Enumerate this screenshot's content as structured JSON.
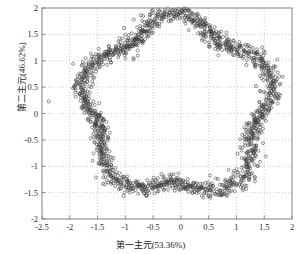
{
  "chart_data": {
    "type": "scatter",
    "title": "",
    "xlabel": "第一主元(53.36%)",
    "ylabel": "第二主元(46.62%)",
    "xlim": [
      -2.5,
      2
    ],
    "ylim": [
      -2,
      2
    ],
    "xticks": [
      -2.5,
      -2,
      -1.5,
      -1,
      -0.5,
      0,
      0.5,
      1,
      1.5,
      2
    ],
    "xtick_labels": [
      "-2.5",
      "-2",
      "-1.5",
      "-1",
      "-0.5",
      "0",
      "0.5",
      "1",
      "1.5",
      "2"
    ],
    "yticks": [
      -2,
      -1.5,
      -1,
      -0.5,
      0,
      0.5,
      1,
      1.5,
      2
    ],
    "ytick_labels": [
      "-2",
      "-1.5",
      "-1",
      "-0.5",
      "0",
      "0.5",
      "1",
      "1.5",
      "2"
    ],
    "grid": true,
    "grid_style": "dotted",
    "grid_color": "#b4b4b4",
    "frame_color": "#808080",
    "legend": null,
    "marker": "open-circle",
    "marker_size": 3.0,
    "marker_edge_color": "#3a3a3a",
    "marker_face_color": "none",
    "n_points": 1600,
    "ring": {
      "center": [
        -0.12,
        0.18
      ],
      "petals": 5,
      "base_radius": 1.62,
      "lobe_amplitude": 0.17,
      "phase_deg": 90,
      "radial_noise": 0.085
    },
    "outliers": [
      [
        -2.38,
        0.23
      ],
      [
        -1.5,
        -0.43
      ],
      [
        -1.02,
        1.62
      ],
      [
        -0.85,
        1.78
      ],
      [
        -0.72,
        1.86
      ],
      [
        -0.62,
        1.56
      ],
      [
        -0.6,
        1.72
      ],
      [
        -0.35,
        -1.15
      ],
      [
        -0.22,
        1.75
      ],
      [
        0.12,
        1.96
      ],
      [
        0.42,
        1.68
      ],
      [
        0.45,
        1.7
      ],
      [
        1.02,
        -0.76
      ],
      [
        1.18,
        0.92
      ],
      [
        1.33,
        -1.2
      ],
      [
        1.35,
        0.52
      ],
      [
        -1.03,
        -1.56
      ],
      [
        -0.62,
        -1.55
      ]
    ]
  },
  "axes": {
    "plot_left_px": 42,
    "plot_right_px": 292,
    "plot_top_px": 8,
    "plot_bottom_px": 219
  }
}
